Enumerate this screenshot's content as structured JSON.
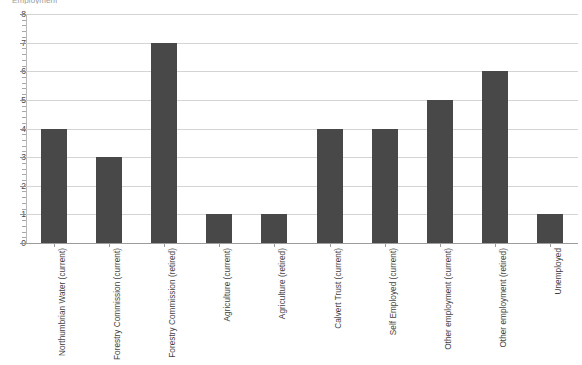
{
  "chart_data": {
    "type": "bar",
    "title": "Employment",
    "xlabel": "",
    "ylabel": "",
    "ylim": [
      0,
      8
    ],
    "yticks": [
      0,
      1,
      2,
      3,
      4,
      5,
      6,
      7,
      8
    ],
    "grid": true,
    "legend": false,
    "bar_color": "#484848",
    "gridline_color": "#d4d4d4",
    "axis_color": "#9c9c9c",
    "minor_ticks_per_interval": 5,
    "categories": [
      "Northumbrian Water (current)",
      "Forestry Commission (current)",
      "Forestry Commission (retired)",
      "Agriculture (current)",
      "Agriculture (retired)",
      "Calvert Trust (current)",
      "Self Employed (current)",
      "Other employment (current)",
      "Other employment (retired)",
      "Unemployed"
    ],
    "values": [
      4,
      3,
      7,
      1,
      1,
      4,
      4,
      5,
      6,
      1
    ]
  }
}
